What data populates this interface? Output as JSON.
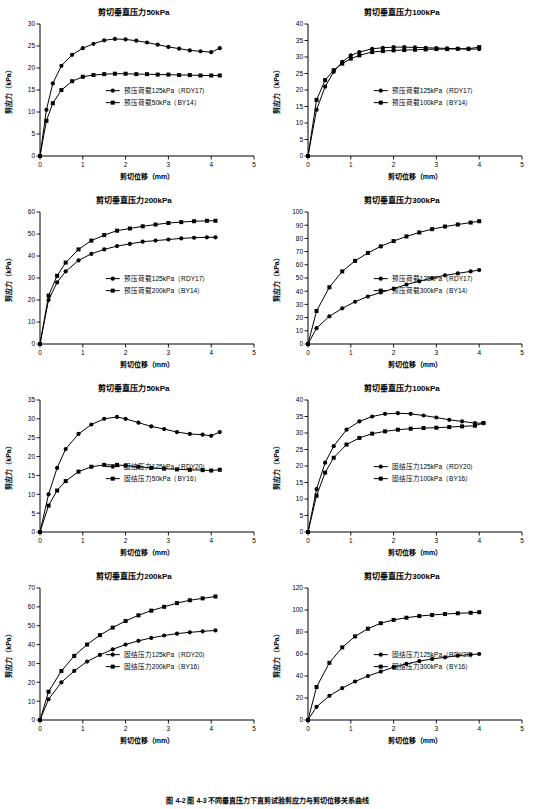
{
  "caption": "图 4-2 图 4-3 不同垂直压力下直剪试验剪应力与剪切位移关系曲线",
  "axis": {
    "x_label": "剪切位移（mm）",
    "y_label": "剪应力（kPa）"
  },
  "chart_data": [
    {
      "type": "line",
      "title": "剪切垂直压力50kPa",
      "xlabel": "剪切位移（mm）",
      "ylabel": "剪应力（kPa）",
      "xlim": [
        0,
        5
      ],
      "ylim": [
        0,
        30
      ],
      "xticks": [
        0,
        1,
        2,
        3,
        4,
        5
      ],
      "yticks": [
        0,
        5,
        10,
        15,
        20,
        25,
        30
      ],
      "grid": false,
      "legend_position": "center",
      "series": [
        {
          "name": "预压荷载125kPa（RDY17）",
          "marker": "circle",
          "x": [
            0,
            0.15,
            0.3,
            0.5,
            0.75,
            1.0,
            1.25,
            1.5,
            1.75,
            2.0,
            2.25,
            2.5,
            2.75,
            3.0,
            3.25,
            3.5,
            3.75,
            4.0,
            4.2
          ],
          "y": [
            0,
            10.5,
            16.5,
            20.5,
            23.0,
            24.5,
            25.5,
            26.3,
            26.6,
            26.5,
            26.2,
            25.8,
            25.3,
            24.8,
            24.4,
            24.0,
            23.8,
            23.6,
            24.5
          ]
        },
        {
          "name": "预压荷载50kPa（BY14）",
          "marker": "square",
          "x": [
            0,
            0.15,
            0.3,
            0.5,
            0.75,
            1.0,
            1.25,
            1.5,
            1.75,
            2.0,
            2.25,
            2.5,
            2.75,
            3.0,
            3.25,
            3.5,
            3.75,
            4.0,
            4.2
          ],
          "y": [
            0,
            8.0,
            12.0,
            15.0,
            17.0,
            18.0,
            18.4,
            18.6,
            18.7,
            18.7,
            18.6,
            18.6,
            18.5,
            18.5,
            18.4,
            18.4,
            18.3,
            18.3,
            18.3
          ]
        }
      ]
    },
    {
      "type": "line",
      "title": "剪切垂直压力100kPa",
      "xlabel": "剪切位移（mm）",
      "ylabel": "剪应力（kPa）",
      "xlim": [
        0,
        5
      ],
      "ylim": [
        0,
        40
      ],
      "xticks": [
        0,
        1,
        2,
        3,
        4,
        5
      ],
      "yticks": [
        0,
        5,
        10,
        15,
        20,
        25,
        30,
        35,
        40
      ],
      "grid": false,
      "legend_position": "center",
      "series": [
        {
          "name": "预压荷载125kPa（RDY17）",
          "marker": "circle",
          "x": [
            0,
            0.2,
            0.4,
            0.6,
            0.8,
            1.0,
            1.2,
            1.5,
            1.75,
            2.0,
            2.25,
            2.5,
            2.75,
            3.0,
            3.25,
            3.5,
            3.75,
            4.0
          ],
          "y": [
            0,
            14.0,
            21.0,
            25.5,
            28.5,
            30.5,
            31.5,
            32.5,
            32.8,
            33.0,
            33.0,
            32.9,
            32.8,
            32.7,
            32.6,
            32.5,
            32.4,
            32.4
          ]
        },
        {
          "name": "预压荷载100kPa（BY14）",
          "marker": "square",
          "x": [
            0,
            0.2,
            0.4,
            0.6,
            0.8,
            1.0,
            1.2,
            1.5,
            1.75,
            2.0,
            2.25,
            2.5,
            2.75,
            3.0,
            3.25,
            3.5,
            3.75,
            4.0
          ],
          "y": [
            0,
            17.0,
            23.0,
            26.0,
            28.0,
            29.5,
            30.5,
            31.5,
            31.8,
            32.0,
            32.1,
            32.2,
            32.3,
            32.4,
            32.4,
            32.5,
            32.5,
            33.0
          ]
        }
      ]
    },
    {
      "type": "line",
      "title": "剪切垂直压力200kPa",
      "xlabel": "剪切位移（mm）",
      "ylabel": "剪应力（kPa）",
      "xlim": [
        0,
        5
      ],
      "ylim": [
        0,
        60
      ],
      "xticks": [
        0,
        1,
        2,
        3,
        4,
        5
      ],
      "yticks": [
        0,
        10,
        20,
        30,
        40,
        50,
        60
      ],
      "grid": false,
      "legend_position": "center",
      "series": [
        {
          "name": "预压荷载125kPa（RDY17）",
          "marker": "circle",
          "x": [
            0,
            0.2,
            0.4,
            0.6,
            0.9,
            1.2,
            1.5,
            1.8,
            2.1,
            2.4,
            2.7,
            3.0,
            3.3,
            3.6,
            3.9,
            4.1
          ],
          "y": [
            0,
            20.0,
            28.0,
            33.0,
            38.0,
            41.0,
            43.0,
            44.5,
            45.5,
            46.5,
            47.0,
            47.5,
            48.0,
            48.3,
            48.5,
            48.5
          ]
        },
        {
          "name": "预压荷载200kPa（BY14）",
          "marker": "square",
          "x": [
            0,
            0.2,
            0.4,
            0.6,
            0.9,
            1.2,
            1.5,
            1.8,
            2.1,
            2.4,
            2.7,
            3.0,
            3.3,
            3.6,
            3.9,
            4.1
          ],
          "y": [
            0,
            22.0,
            31.0,
            37.0,
            43.0,
            47.0,
            49.5,
            51.5,
            52.5,
            53.5,
            54.3,
            55.0,
            55.4,
            55.8,
            56.0,
            56.0
          ]
        }
      ]
    },
    {
      "type": "line",
      "title": "剪切垂直压力300kPa",
      "xlabel": "剪切位移（mm）",
      "ylabel": "剪应力（kPa）",
      "xlim": [
        0,
        5
      ],
      "ylim": [
        0,
        100
      ],
      "xticks": [
        0,
        1,
        2,
        3,
        4,
        5
      ],
      "yticks": [
        0,
        10,
        20,
        30,
        40,
        50,
        60,
        70,
        80,
        90,
        100
      ],
      "grid": false,
      "legend_position": "center",
      "series": [
        {
          "name": "预压荷载125kPa（RDY17）",
          "marker": "circle",
          "x": [
            0,
            0.2,
            0.5,
            0.8,
            1.1,
            1.4,
            1.7,
            2.0,
            2.3,
            2.6,
            2.9,
            3.2,
            3.5,
            3.8,
            4.0
          ],
          "y": [
            0,
            12.0,
            21.0,
            27.0,
            32.0,
            36.0,
            39.0,
            42.0,
            45.0,
            47.5,
            50.0,
            52.0,
            53.5,
            55.0,
            56.0
          ]
        },
        {
          "name": "预压荷载300kPa（BY14）",
          "marker": "square",
          "x": [
            0,
            0.2,
            0.5,
            0.8,
            1.1,
            1.4,
            1.7,
            2.0,
            2.3,
            2.6,
            2.9,
            3.2,
            3.5,
            3.8,
            4.0
          ],
          "y": [
            0,
            25.0,
            43.0,
            55.0,
            63.0,
            69.0,
            74.0,
            78.0,
            81.5,
            84.5,
            87.0,
            89.0,
            90.5,
            92.0,
            93.0
          ]
        }
      ]
    },
    {
      "type": "line",
      "title": "剪切垂直压力50kPa",
      "xlabel": "剪切位移（mm）",
      "ylabel": "剪应力（kPa）",
      "xlim": [
        0,
        5
      ],
      "ylim": [
        0,
        35
      ],
      "xticks": [
        0,
        1,
        2,
        3,
        4,
        5
      ],
      "yticks": [
        0,
        5,
        10,
        15,
        20,
        25,
        30,
        35
      ],
      "grid": false,
      "legend_position": "center",
      "series": [
        {
          "name": "固结压力125kPa（RDY20）",
          "marker": "circle",
          "x": [
            0,
            0.2,
            0.4,
            0.6,
            0.9,
            1.2,
            1.5,
            1.8,
            2.0,
            2.3,
            2.6,
            2.9,
            3.2,
            3.5,
            3.8,
            4.0,
            4.2
          ],
          "y": [
            0,
            10.0,
            17.0,
            22.0,
            26.0,
            28.5,
            30.0,
            30.5,
            30.0,
            29.0,
            28.0,
            27.3,
            26.5,
            26.0,
            25.8,
            25.5,
            26.5
          ]
        },
        {
          "name": "固结压力50kPa（BY16）",
          "marker": "square",
          "x": [
            0,
            0.2,
            0.4,
            0.6,
            0.9,
            1.2,
            1.5,
            1.8,
            2.0,
            2.3,
            2.6,
            2.9,
            3.2,
            3.5,
            3.8,
            4.0,
            4.2
          ],
          "y": [
            0,
            7.0,
            11.0,
            13.5,
            16.0,
            17.3,
            17.8,
            17.8,
            17.6,
            17.3,
            17.0,
            16.8,
            16.6,
            16.5,
            16.4,
            16.3,
            16.5
          ]
        }
      ]
    },
    {
      "type": "line",
      "title": "剪切垂直压力100kPa",
      "xlabel": "剪切位移（mm）",
      "ylabel": "剪应力（kPa）",
      "xlim": [
        0,
        5
      ],
      "ylim": [
        0,
        40
      ],
      "xticks": [
        0,
        1,
        2,
        3,
        4,
        5
      ],
      "yticks": [
        0,
        5,
        10,
        15,
        20,
        25,
        30,
        35,
        40
      ],
      "grid": false,
      "legend_position": "center",
      "series": [
        {
          "name": "固结压力125kPa（RDY20）",
          "marker": "circle",
          "x": [
            0,
            0.2,
            0.4,
            0.6,
            0.9,
            1.2,
            1.5,
            1.8,
            2.1,
            2.4,
            2.7,
            3.0,
            3.3,
            3.6,
            3.9,
            4.1
          ],
          "y": [
            0,
            13.0,
            21.0,
            26.0,
            31.0,
            33.5,
            35.0,
            35.8,
            36.0,
            35.8,
            35.3,
            34.7,
            34.0,
            33.5,
            33.0,
            33.0
          ]
        },
        {
          "name": "固结压力100kPa（BY16）",
          "marker": "square",
          "x": [
            0,
            0.2,
            0.4,
            0.6,
            0.9,
            1.2,
            1.5,
            1.8,
            2.1,
            2.4,
            2.7,
            3.0,
            3.3,
            3.6,
            3.9,
            4.1
          ],
          "y": [
            0,
            11.0,
            18.0,
            22.5,
            26.5,
            28.5,
            29.8,
            30.5,
            31.0,
            31.3,
            31.5,
            31.6,
            31.8,
            32.0,
            32.2,
            33.0
          ]
        }
      ]
    },
    {
      "type": "line",
      "title": "剪切垂直压力200kPa",
      "xlabel": "剪切位移（mm）",
      "ylabel": "剪应力（kPa）",
      "xlim": [
        0,
        5
      ],
      "ylim": [
        0,
        70
      ],
      "xticks": [
        0,
        1,
        2,
        3,
        4,
        5
      ],
      "yticks": [
        0,
        10,
        20,
        30,
        40,
        50,
        60,
        70
      ],
      "grid": false,
      "legend_position": "center",
      "series": [
        {
          "name": "固结压力125kPa（RDY20）",
          "marker": "circle",
          "x": [
            0,
            0.2,
            0.5,
            0.8,
            1.1,
            1.4,
            1.7,
            2.0,
            2.3,
            2.6,
            2.9,
            3.2,
            3.5,
            3.8,
            4.1
          ],
          "y": [
            0,
            11.0,
            20.0,
            26.0,
            31.0,
            34.5,
            37.5,
            40.0,
            42.0,
            43.5,
            44.8,
            45.8,
            46.5,
            47.0,
            47.5
          ]
        },
        {
          "name": "固结压力200kPa（BY16）",
          "marker": "square",
          "x": [
            0,
            0.2,
            0.5,
            0.8,
            1.1,
            1.4,
            1.7,
            2.0,
            2.3,
            2.6,
            2.9,
            3.2,
            3.5,
            3.8,
            4.1
          ],
          "y": [
            0,
            15.0,
            26.0,
            34.0,
            40.0,
            45.0,
            49.0,
            52.5,
            55.5,
            58.0,
            60.0,
            62.0,
            63.5,
            64.5,
            65.5
          ]
        }
      ]
    },
    {
      "type": "line",
      "title": "剪切垂直压力300kPa",
      "xlabel": "剪切位移（mm）",
      "ylabel": "剪应力（kPa）",
      "xlim": [
        0,
        5
      ],
      "ylim": [
        0,
        120
      ],
      "xticks": [
        0,
        1,
        2,
        3,
        4,
        5
      ],
      "yticks": [
        0,
        20,
        40,
        60,
        80,
        100,
        120
      ],
      "grid": false,
      "legend_position": "center",
      "series": [
        {
          "name": "固结压力125kPa（RDY20）",
          "marker": "circle",
          "x": [
            0,
            0.2,
            0.5,
            0.8,
            1.1,
            1.4,
            1.7,
            2.0,
            2.3,
            2.6,
            2.9,
            3.2,
            3.5,
            3.8,
            4.0
          ],
          "y": [
            0,
            12.0,
            22.0,
            29.0,
            35.0,
            40.0,
            44.0,
            48.0,
            51.0,
            53.5,
            55.5,
            57.0,
            58.5,
            59.5,
            60.0
          ]
        },
        {
          "name": "固结压力300kPa（BY16）",
          "marker": "square",
          "x": [
            0,
            0.2,
            0.5,
            0.8,
            1.1,
            1.4,
            1.7,
            2.0,
            2.3,
            2.6,
            2.9,
            3.2,
            3.5,
            3.8,
            4.0
          ],
          "y": [
            0,
            30.0,
            52.0,
            66.0,
            76.0,
            83.0,
            88.0,
            91.0,
            93.0,
            94.5,
            95.5,
            96.3,
            97.0,
            97.5,
            98.0
          ]
        }
      ]
    }
  ]
}
